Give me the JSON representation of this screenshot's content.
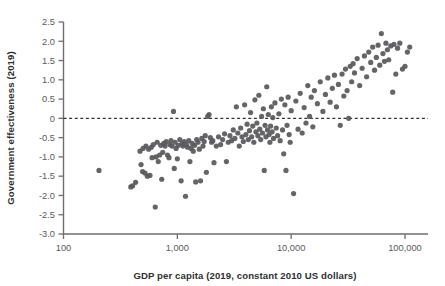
{
  "chart_data": {
    "type": "scatter",
    "title": "",
    "xlabel": "GDP per capita (2019, constant 2010 US dollars)",
    "ylabel": "Government effectiveness (2019)",
    "xscale": "log",
    "yscale": "linear",
    "xlim": [
      100,
      160000
    ],
    "ylim": [
      -3.0,
      2.5
    ],
    "grid": false,
    "legend": null,
    "xticks": [
      100,
      1000,
      10000,
      100000
    ],
    "xtick_labels": [
      "100",
      "1,000",
      "10,000",
      "100,000"
    ],
    "yticks": [
      -3.0,
      -2.5,
      -2.0,
      -1.5,
      -1.0,
      -0.5,
      0,
      0.5,
      1.0,
      1.5,
      2.0,
      2.5
    ],
    "ytick_labels": [
      "-3.0",
      "-2.5",
      "-2.0",
      "-1.5",
      "-1.0",
      "-0.5",
      "0",
      "0.5",
      "1.0",
      "1.5",
      "2.0",
      "2.5"
    ],
    "annotations": [
      {
        "type": "hline",
        "y": 0,
        "style": "dashed",
        "label": "zero-reference-line"
      }
    ],
    "marker": {
      "shape": "circle",
      "radius": 2.6,
      "color": "#58585a",
      "opacity": 0.92
    },
    "points": [
      [
        205,
        -1.35
      ],
      [
        390,
        -1.78
      ],
      [
        405,
        -1.75
      ],
      [
        430,
        -1.66
      ],
      [
        470,
        -0.85
      ],
      [
        480,
        -1.2
      ],
      [
        495,
        -1.38
      ],
      [
        500,
        -0.78
      ],
      [
        520,
        -1.42
      ],
      [
        530,
        -0.72
      ],
      [
        545,
        -1.5
      ],
      [
        560,
        -0.8
      ],
      [
        575,
        -1.48
      ],
      [
        590,
        -0.75
      ],
      [
        600,
        -1.02
      ],
      [
        615,
        -0.68
      ],
      [
        640,
        -2.3
      ],
      [
        650,
        -1.0
      ],
      [
        665,
        -0.62
      ],
      [
        680,
        -1.12
      ],
      [
        700,
        -0.95
      ],
      [
        715,
        -0.7
      ],
      [
        730,
        -1.58
      ],
      [
        745,
        -0.88
      ],
      [
        760,
        -0.65
      ],
      [
        780,
        -0.72
      ],
      [
        800,
        -0.6
      ],
      [
        820,
        -0.95
      ],
      [
        845,
        -1.02
      ],
      [
        860,
        -0.68
      ],
      [
        880,
        -0.58
      ],
      [
        900,
        -0.72
      ],
      [
        925,
        0.18
      ],
      [
        940,
        -1.3
      ],
      [
        955,
        -0.62
      ],
      [
        975,
        -0.78
      ],
      [
        1000,
        -1.05
      ],
      [
        1020,
        -0.7
      ],
      [
        1050,
        -0.55
      ],
      [
        1080,
        -1.62
      ],
      [
        1100,
        -0.66
      ],
      [
        1120,
        -0.72
      ],
      [
        1150,
        -0.6
      ],
      [
        1180,
        -2.02
      ],
      [
        1200,
        -0.68
      ],
      [
        1230,
        -0.75
      ],
      [
        1260,
        -0.58
      ],
      [
        1290,
        -1.12
      ],
      [
        1320,
        -0.78
      ],
      [
        1350,
        -0.65
      ],
      [
        1380,
        -0.85
      ],
      [
        1420,
        -0.7
      ],
      [
        1450,
        -1.65
      ],
      [
        1480,
        -0.55
      ],
      [
        1520,
        -0.62
      ],
      [
        1560,
        -0.8
      ],
      [
        1600,
        -1.62
      ],
      [
        1640,
        -0.52
      ],
      [
        1680,
        -0.72
      ],
      [
        1720,
        -0.6
      ],
      [
        1760,
        -0.45
      ],
      [
        1800,
        -1.4
      ],
      [
        1850,
        0.05
      ],
      [
        1900,
        0.1
      ],
      [
        1950,
        -0.5
      ],
      [
        2000,
        -0.62
      ],
      [
        2050,
        -0.58
      ],
      [
        2100,
        -1.15
      ],
      [
        2200,
        -0.72
      ],
      [
        2300,
        -0.48
      ],
      [
        2400,
        -0.68
      ],
      [
        2500,
        -0.55
      ],
      [
        2600,
        -0.4
      ],
      [
        2700,
        -1.12
      ],
      [
        2800,
        -0.62
      ],
      [
        2900,
        -0.45
      ],
      [
        3000,
        -0.58
      ],
      [
        3100,
        -0.3
      ],
      [
        3200,
        -0.52
      ],
      [
        3300,
        0.3
      ],
      [
        3400,
        -0.38
      ],
      [
        3500,
        -0.72
      ],
      [
        3600,
        -0.25
      ],
      [
        3700,
        -0.48
      ],
      [
        3800,
        -0.6
      ],
      [
        3900,
        0.35
      ],
      [
        4000,
        -0.42
      ],
      [
        4100,
        -0.15
      ],
      [
        4200,
        -0.55
      ],
      [
        4300,
        -0.32
      ],
      [
        4400,
        0.15
      ],
      [
        4500,
        -0.48
      ],
      [
        4600,
        -0.2
      ],
      [
        4700,
        -0.62
      ],
      [
        4800,
        0.48
      ],
      [
        4900,
        -0.35
      ],
      [
        5000,
        -0.12
      ],
      [
        5100,
        -0.45
      ],
      [
        5200,
        0.6
      ],
      [
        5300,
        -0.28
      ],
      [
        5400,
        -0.55
      ],
      [
        5500,
        0.05
      ],
      [
        5600,
        -0.38
      ],
      [
        5700,
        0.25
      ],
      [
        5800,
        -1.35
      ],
      [
        5900,
        -0.18
      ],
      [
        6000,
        -0.48
      ],
      [
        6100,
        0.82
      ],
      [
        6200,
        -0.3
      ],
      [
        6300,
        0.1
      ],
      [
        6400,
        -0.42
      ],
      [
        6500,
        -0.62
      ],
      [
        6600,
        -0.2
      ],
      [
        6700,
        0.3
      ],
      [
        6800,
        -0.35
      ],
      [
        6900,
        0.02
      ],
      [
        7000,
        -0.52
      ],
      [
        7200,
        0.4
      ],
      [
        7400,
        -0.25
      ],
      [
        7600,
        -0.45
      ],
      [
        7800,
        0.12
      ],
      [
        8000,
        -0.58
      ],
      [
        8200,
        0.5
      ],
      [
        8400,
        -0.3
      ],
      [
        8600,
        -0.92
      ],
      [
        8800,
        0.35
      ],
      [
        9000,
        -1.35
      ],
      [
        9200,
        -0.18
      ],
      [
        9400,
        0.55
      ],
      [
        9600,
        -0.42
      ],
      [
        9800,
        -0.62
      ],
      [
        10000,
        0.2
      ],
      [
        10500,
        -1.95
      ],
      [
        11000,
        0.45
      ],
      [
        11500,
        -0.28
      ],
      [
        12000,
        0.65
      ],
      [
        12500,
        -0.38
      ],
      [
        13000,
        0.28
      ],
      [
        13500,
        -0.12
      ],
      [
        14000,
        0.85
      ],
      [
        14500,
        0.05
      ],
      [
        15000,
        0.55
      ],
      [
        15500,
        -0.22
      ],
      [
        16000,
        0.72
      ],
      [
        17000,
        0.38
      ],
      [
        18000,
        0.95
      ],
      [
        19000,
        0.18
      ],
      [
        20000,
        0.62
      ],
      [
        21000,
        1.05
      ],
      [
        22000,
        0.42
      ],
      [
        23000,
        0.78
      ],
      [
        24000,
        1.12
      ],
      [
        25000,
        0.3
      ],
      [
        26000,
        0.88
      ],
      [
        27000,
        -0.18
      ],
      [
        28000,
        1.15
      ],
      [
        29000,
        0.58
      ],
      [
        30000,
        1.28
      ],
      [
        31000,
        0.72
      ],
      [
        32000,
        0.0
      ],
      [
        33000,
        1.35
      ],
      [
        34000,
        0.95
      ],
      [
        35000,
        1.42
      ],
      [
        36000,
        1.18
      ],
      [
        38000,
        1.55
      ],
      [
        40000,
        0.85
      ],
      [
        42000,
        1.3
      ],
      [
        44000,
        1.62
      ],
      [
        46000,
        1.08
      ],
      [
        48000,
        1.72
      ],
      [
        50000,
        1.45
      ],
      [
        52000,
        1.85
      ],
      [
        54000,
        1.25
      ],
      [
        56000,
        1.58
      ],
      [
        58000,
        1.9
      ],
      [
        60000,
        1.38
      ],
      [
        62000,
        2.2
      ],
      [
        64000,
        1.68
      ],
      [
        66000,
        1.48
      ],
      [
        68000,
        1.95
      ],
      [
        70000,
        1.78
      ],
      [
        72000,
        1.52
      ],
      [
        75000,
        1.88
      ],
      [
        78000,
        0.68
      ],
      [
        80000,
        1.92
      ],
      [
        83000,
        1.15
      ],
      [
        86000,
        1.82
      ],
      [
        90000,
        1.95
      ],
      [
        95000,
        1.28
      ],
      [
        100000,
        1.35
      ],
      [
        105000,
        1.72
      ],
      [
        110000,
        1.85
      ]
    ]
  },
  "axis": {
    "line_color": "#6e6e6e",
    "zero_line_color": "#333333"
  }
}
